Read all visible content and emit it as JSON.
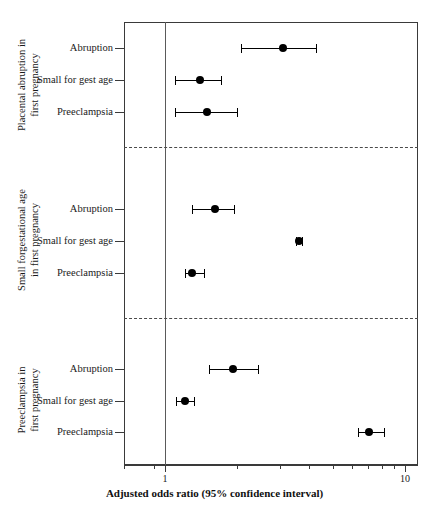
{
  "chart_data": {
    "type": "scatter",
    "subtype": "forest-plot",
    "title": "",
    "xlabel": "Adjusted odds ratio (95% confidence interval)",
    "ylabel": "",
    "xscale": "log",
    "xlim": [
      0.8,
      10
    ],
    "xticks_major": [
      1,
      10
    ],
    "xticklabels": [
      "1",
      "10"
    ],
    "xticks_minor": [
      0.9,
      2,
      3,
      4,
      5,
      6,
      7,
      8,
      9
    ],
    "reference_line": 1,
    "grid": false,
    "legend": "none",
    "groups": [
      {
        "label": "Placental abruption in first pregnancy",
        "label_lines": [
          "Placental abruption in",
          "first pregnancy"
        ],
        "rows": [
          {
            "label": "Abruption",
            "or": 3.1,
            "ci_low": 2.07,
            "ci_high": 4.26
          },
          {
            "label": "Small for gest age",
            "or": 1.4,
            "ci_low": 1.1,
            "ci_high": 1.71
          },
          {
            "label": "Preeclampsia",
            "or": 1.5,
            "ci_low": 1.1,
            "ci_high": 2.0
          }
        ]
      },
      {
        "label": "Small forgestational age in first pregnancy",
        "label_lines": [
          "Small forgestational age",
          "in first pregnancy"
        ],
        "rows": [
          {
            "label": "Abruption",
            "or": 1.62,
            "ci_low": 1.3,
            "ci_high": 1.94
          },
          {
            "label": "Small for gest age",
            "or": 3.6,
            "ci_low": 3.5,
            "ci_high": 3.72
          },
          {
            "label": "Preeclampsia",
            "or": 1.3,
            "ci_low": 1.21,
            "ci_high": 1.45
          }
        ]
      },
      {
        "label": "Preeclampsia in first pregnancy",
        "label_lines": [
          "Preeclampsia in",
          "first pregnancy"
        ],
        "rows": [
          {
            "label": "Abruption",
            "or": 1.92,
            "ci_low": 1.52,
            "ci_high": 2.45
          },
          {
            "label": "Small for gest age",
            "or": 1.21,
            "ci_low": 1.11,
            "ci_high": 1.32
          },
          {
            "label": "Preeclampsia",
            "or": 7.1,
            "ci_low": 6.4,
            "ci_high": 8.2
          }
        ]
      }
    ]
  },
  "axis": {
    "x_title": "Adjusted odds ratio (95% confidence interval)",
    "tick_1": "1",
    "tick_10": "10"
  }
}
